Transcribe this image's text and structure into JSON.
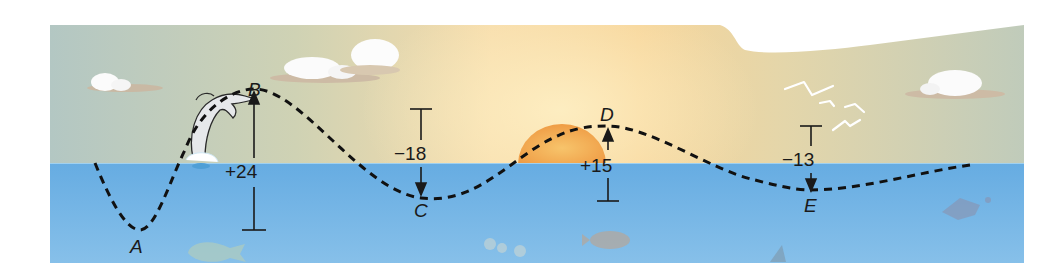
{
  "diagram": {
    "title": "",
    "points": [
      {
        "id": "A",
        "label": "A"
      },
      {
        "id": "B",
        "label": "B"
      },
      {
        "id": "C",
        "label": "C"
      },
      {
        "id": "D",
        "label": "D"
      },
      {
        "id": "E",
        "label": "E"
      }
    ],
    "changes": [
      {
        "from": "A",
        "to": "B",
        "label": "+24",
        "direction": "up"
      },
      {
        "from": "B",
        "to": "C",
        "label": "−18",
        "direction": "down"
      },
      {
        "from": "C",
        "to": "D",
        "label": "+15",
        "direction": "up"
      },
      {
        "from": "D",
        "to": "E",
        "label": "−13",
        "direction": "down"
      }
    ],
    "colors": {
      "sky_left": "#b7c9c2",
      "sky_center": "#f6d9a0",
      "sky_right": "#c3cdb9",
      "sea": "#6fb1e3",
      "sea_deep": "#83bde8",
      "sun": "#f2a54a",
      "path": "#111111"
    }
  }
}
